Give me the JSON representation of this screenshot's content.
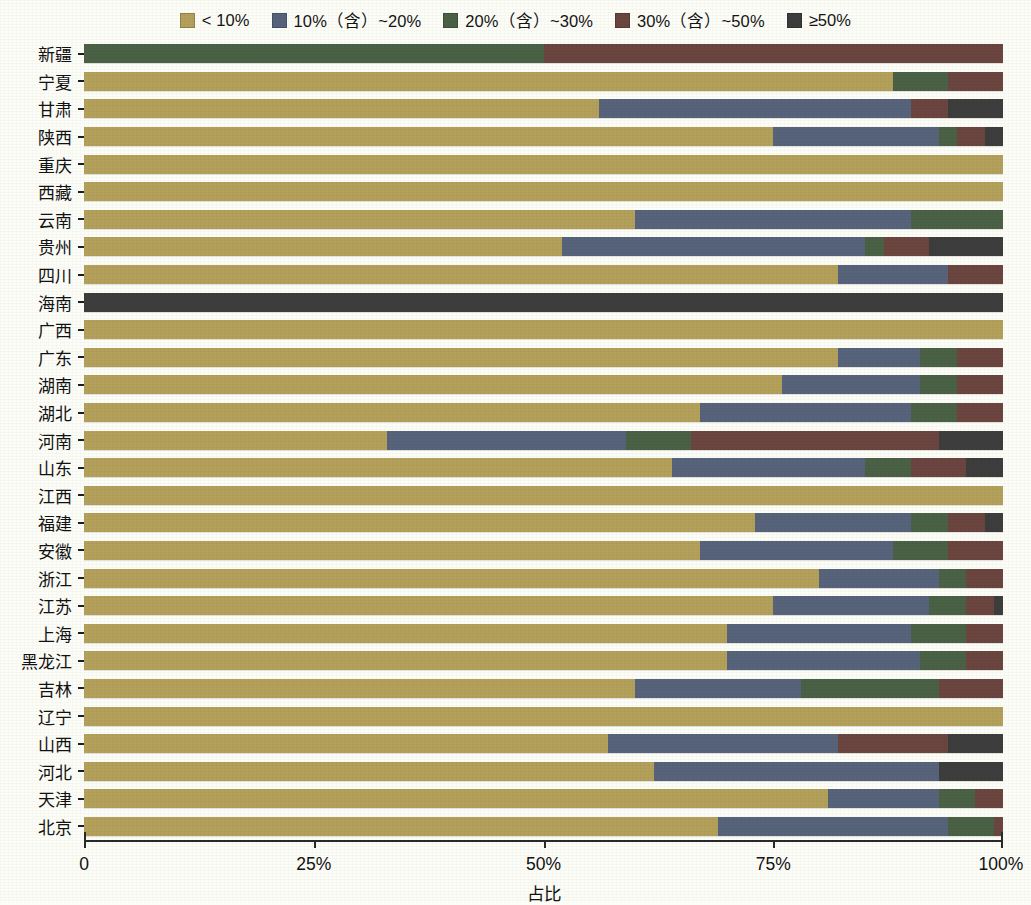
{
  "legend": {
    "items": [
      {
        "label": "< 10%",
        "color": "#b3a05a",
        "icon": "color-swatch"
      },
      {
        "label": "10%（含）~20%",
        "color": "#56637a",
        "icon": "color-swatch"
      },
      {
        "label": "20%（含）~30%",
        "color": "#4a6146",
        "icon": "color-swatch"
      },
      {
        "label": "30%（含）~50%",
        "color": "#6b4540",
        "icon": "color-swatch"
      },
      {
        "label": "≥50%",
        "color": "#3d3d3d",
        "icon": "color-swatch"
      }
    ]
  },
  "axis": {
    "x_title": "占比",
    "x_ticks": [
      "0",
      "25%",
      "50%",
      "75%",
      "100%"
    ],
    "x_tick_values": [
      0,
      25,
      50,
      75,
      100
    ]
  },
  "chart_data": {
    "type": "bar",
    "orientation": "horizontal",
    "stacked": true,
    "normalized": "100%",
    "title": "",
    "xlabel": "占比",
    "ylabel": "",
    "xlim": [
      0,
      100
    ],
    "grid": false,
    "legend_position": "top-center",
    "series": [
      {
        "name": "< 10%",
        "color": "#b3a05a",
        "values": [
          0,
          88,
          56,
          75,
          100,
          100,
          60,
          52,
          82,
          0,
          100,
          82,
          76,
          67,
          33,
          64,
          100,
          73,
          67,
          80,
          75,
          70,
          70,
          60,
          100,
          57,
          62,
          81,
          69
        ]
      },
      {
        "name": "10%（含）~20%",
        "color": "#56637a",
        "values": [
          0,
          0,
          34,
          18,
          0,
          0,
          30,
          33,
          12,
          0,
          0,
          9,
          15,
          23,
          26,
          21,
          0,
          17,
          21,
          13,
          17,
          20,
          21,
          18,
          0,
          25,
          31,
          12,
          25
        ]
      },
      {
        "name": "20%（含）~30%",
        "color": "#4a6146",
        "values": [
          50,
          6,
          0,
          2,
          0,
          0,
          10,
          2,
          0,
          0,
          0,
          4,
          4,
          5,
          7,
          5,
          0,
          4,
          6,
          3,
          4,
          6,
          5,
          15,
          0,
          0,
          0,
          4,
          5
        ]
      },
      {
        "name": "30%（含）~50%",
        "color": "#6b4540",
        "values": [
          50,
          6,
          4,
          3,
          0,
          0,
          0,
          5,
          6,
          0,
          0,
          5,
          5,
          5,
          27,
          6,
          0,
          4,
          6,
          4,
          3,
          4,
          4,
          7,
          0,
          12,
          0,
          3,
          1
        ]
      },
      {
        "name": "≥50%",
        "color": "#3d3d3d",
        "values": [
          0,
          0,
          6,
          2,
          0,
          0,
          0,
          8,
          0,
          100,
          0,
          0,
          0,
          0,
          7,
          4,
          0,
          2,
          0,
          0,
          1,
          0,
          0,
          0,
          0,
          6,
          7,
          0,
          0
        ]
      }
    ],
    "categories": [
      "新疆",
      "宁夏",
      "甘肃",
      "陕西",
      "重庆",
      "西藏",
      "云南",
      "贵州",
      "四川",
      "海南",
      "广西",
      "广东",
      "湖南",
      "湖北",
      "河南",
      "山东",
      "江西",
      "福建",
      "安徽",
      "浙江",
      "江苏",
      "上海",
      "黑龙江",
      "吉林",
      "辽宁",
      "山西",
      "河北",
      "天津",
      "北京"
    ]
  }
}
